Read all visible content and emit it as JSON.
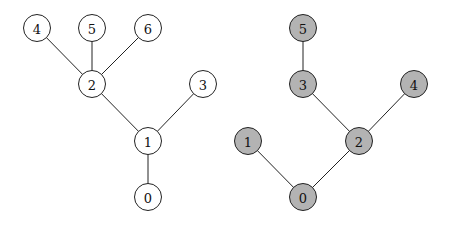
{
  "trees": [
    {
      "id": "left",
      "fill": "#ffffff",
      "nodes": [
        {
          "label": "4",
          "x": 37,
          "y": 28
        },
        {
          "label": "5",
          "x": 92,
          "y": 28
        },
        {
          "label": "6",
          "x": 148,
          "y": 28
        },
        {
          "label": "2",
          "x": 92,
          "y": 84
        },
        {
          "label": "3",
          "x": 203,
          "y": 84
        },
        {
          "label": "1",
          "x": 148,
          "y": 141
        },
        {
          "label": "0",
          "x": 148,
          "y": 197
        }
      ],
      "edges": [
        [
          0,
          3
        ],
        [
          1,
          3
        ],
        [
          2,
          3
        ],
        [
          3,
          5
        ],
        [
          4,
          5
        ],
        [
          5,
          6
        ]
      ]
    },
    {
      "id": "right",
      "fill": "#b3b3b3",
      "nodes": [
        {
          "label": "5",
          "x": 303,
          "y": 28
        },
        {
          "label": "3",
          "x": 303,
          "y": 84
        },
        {
          "label": "4",
          "x": 414,
          "y": 84
        },
        {
          "label": "1",
          "x": 248,
          "y": 141
        },
        {
          "label": "2",
          "x": 359,
          "y": 141
        },
        {
          "label": "0",
          "x": 303,
          "y": 197
        }
      ],
      "edges": [
        [
          0,
          1
        ],
        [
          1,
          4
        ],
        [
          2,
          4
        ],
        [
          3,
          5
        ],
        [
          4,
          5
        ]
      ]
    }
  ],
  "node_radius": 13.5
}
